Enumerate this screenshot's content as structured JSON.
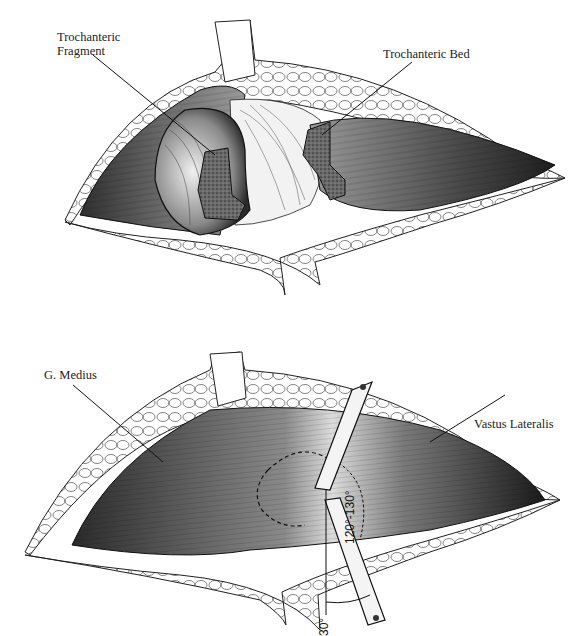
{
  "figure": {
    "top_panel": {
      "labels": {
        "fragment": "Trochanteric\nFragment",
        "bed": "Trochanteric Bed"
      }
    },
    "bottom_panel": {
      "labels": {
        "medius": "G. Medius",
        "vastus": "Vastus Lateralis",
        "angle_osteotomy": "120°-130°",
        "angle_saw": "30°"
      }
    },
    "colors": {
      "ink": "#111111",
      "muscle_dark": "#3a3a3a",
      "muscle_light": "#d8d8d8",
      "bone_cut": "#5a5a5a",
      "fat": "#ffffff"
    }
  }
}
